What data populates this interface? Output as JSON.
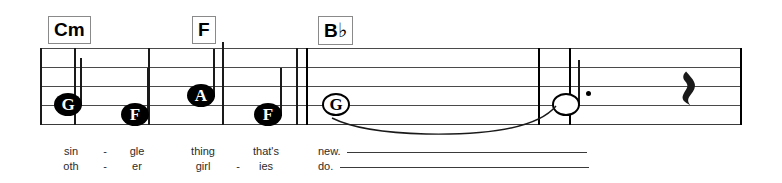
{
  "sheet": {
    "width": 782,
    "height": 183,
    "background": "#ffffff",
    "ink_color": "#1a1a1a",
    "staff_line_color": "#4a4a4a",
    "chord_box_border_color": "#8a8a8a"
  },
  "chords": [
    {
      "label": "Cm",
      "root": "C",
      "quality": "m",
      "x": 48
    },
    {
      "label": "F",
      "root": "F",
      "quality": "",
      "x": 192
    },
    {
      "label": "B",
      "accidental": "♭",
      "root": "B",
      "quality": "",
      "x": 318
    }
  ],
  "notes": [
    {
      "letter": "G",
      "style": "filled",
      "stem": "up",
      "dotted": false,
      "x": 54,
      "y": 93
    },
    {
      "letter": "F",
      "style": "filled",
      "stem": "up",
      "dotted": false,
      "x": 121,
      "y": 103
    },
    {
      "letter": "A",
      "style": "filled",
      "stem": "up",
      "dotted": false,
      "x": 187,
      "y": 84
    },
    {
      "letter": "F",
      "style": "filled",
      "stem": "up",
      "dotted": false,
      "x": 254,
      "y": 103
    },
    {
      "letter": "G",
      "style": "open",
      "stem": "none",
      "dotted": false,
      "x": 322,
      "y": 93
    },
    {
      "letter": "",
      "style": "open",
      "stem": "up",
      "dotted": true,
      "x": 552,
      "y": 93
    }
  ],
  "rests": [
    {
      "type": "quarter-rest",
      "glyph": "𝄽",
      "x": 678,
      "y": 64
    }
  ],
  "lyrics": {
    "verse1": [
      {
        "text": "sin",
        "x": 71
      },
      {
        "text": "-",
        "x": 105
      },
      {
        "text": "gle",
        "x": 137
      },
      {
        "text": "thing",
        "x": 203
      },
      {
        "text": "that's",
        "x": 266
      },
      {
        "text": "new.",
        "x": 330
      }
    ],
    "verse2": [
      {
        "text": "oth",
        "x": 71
      },
      {
        "text": "-",
        "x": 105
      },
      {
        "text": "er",
        "x": 137
      },
      {
        "text": "girl",
        "x": 203
      },
      {
        "text": "-",
        "x": 238
      },
      {
        "text": "ies",
        "x": 266
      },
      {
        "text": "do.",
        "x": 328
      }
    ],
    "extenders": [
      {
        "row": 1,
        "x1": 347,
        "x2": 587,
        "y": 152
      },
      {
        "row": 2,
        "x1": 340,
        "x2": 589,
        "y": 167
      }
    ]
  },
  "staff": {
    "left": 40,
    "right": 742,
    "line_ys": [
      48,
      67,
      86,
      105,
      124
    ],
    "barlines": [
      {
        "x": 40,
        "y1": 48,
        "y2": 125,
        "weight": "normal"
      },
      {
        "x": 74,
        "y1": 48,
        "y2": 125,
        "weight": "normal"
      },
      {
        "x": 148,
        "y1": 48,
        "y2": 125,
        "weight": "normal"
      },
      {
        "x": 222,
        "y1": 42,
        "y2": 125,
        "weight": "normal"
      },
      {
        "x": 222,
        "y1": 48,
        "y2": 125,
        "weight": "normal"
      },
      {
        "x": 296,
        "y1": 48,
        "y2": 125,
        "weight": "normal"
      },
      {
        "x": 306,
        "y1": 48,
        "y2": 125,
        "weight": "heavy"
      },
      {
        "x": 538,
        "y1": 48,
        "y2": 125,
        "weight": "heavy"
      },
      {
        "x": 569,
        "y1": 48,
        "y2": 125,
        "weight": "heavy"
      },
      {
        "x": 741,
        "y1": 48,
        "y2": 125,
        "weight": "heavy"
      }
    ]
  },
  "tie": {
    "from_note_index": 4,
    "to_note_index": 5,
    "start_x": 340,
    "end_x": 556,
    "direction": "under"
  }
}
